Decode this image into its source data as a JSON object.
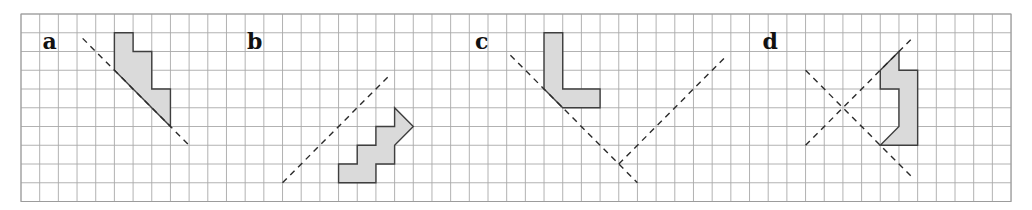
{
  "figure": {
    "grid": {
      "origin_x": 21,
      "origin_y": 14,
      "cols": 53,
      "rows": 10,
      "cell_w": 18.68,
      "cell_h": 18.75,
      "line_color": "#a9a9a9"
    },
    "colors": {
      "shape_fill": "#dadada",
      "shape_stroke": "#3e3e3e",
      "mirror_line": "#2a2a2a"
    },
    "panels": [
      {
        "label": "a",
        "label_pos": [
          1.15,
          1.85
        ],
        "shape": [
          [
            5,
            1
          ],
          [
            6,
            1
          ],
          [
            6,
            2
          ],
          [
            7,
            2
          ],
          [
            7,
            4
          ],
          [
            8,
            4
          ],
          [
            8,
            6
          ],
          [
            5,
            3
          ]
        ],
        "mirror_lines": [
          [
            [
              3.3,
              1.3
            ],
            [
              9,
              7
            ]
          ]
        ]
      },
      {
        "label": "b",
        "label_pos": [
          12.1,
          1.85
        ],
        "shape": [
          [
            17,
            9
          ],
          [
            19,
            9
          ],
          [
            19,
            8
          ],
          [
            20,
            8
          ],
          [
            20,
            7
          ],
          [
            21,
            6
          ],
          [
            20,
            5
          ],
          [
            20,
            6
          ],
          [
            19,
            6
          ],
          [
            19,
            7
          ],
          [
            18,
            7
          ],
          [
            18,
            8
          ],
          [
            17,
            8
          ]
        ],
        "mirror_lines": [
          [
            [
              14,
              9
            ],
            [
              19.8,
              3.2
            ]
          ]
        ]
      },
      {
        "label": "c",
        "label_pos": [
          24.3,
          1.85
        ],
        "shape": [
          [
            28,
            1
          ],
          [
            29,
            1
          ],
          [
            29,
            4
          ],
          [
            31,
            4
          ],
          [
            31,
            5
          ],
          [
            29,
            5
          ],
          [
            28,
            4
          ]
        ],
        "mirror_lines": [
          [
            [
              26.2,
              2.2
            ],
            [
              33,
              9
            ]
          ],
          [
            [
              32,
              8
            ],
            [
              37.8,
              2.2
            ]
          ]
        ]
      },
      {
        "label": "d",
        "label_pos": [
          39.7,
          1.85
        ],
        "shape": [
          [
            46,
            3
          ],
          [
            47,
            2
          ],
          [
            47,
            3
          ],
          [
            48,
            3
          ],
          [
            48,
            7
          ],
          [
            46,
            7
          ],
          [
            47,
            6
          ],
          [
            47,
            4
          ],
          [
            46,
            4
          ]
        ],
        "mirror_lines": [
          [
            [
              42,
              7
            ],
            [
              47.8,
              1.2
            ]
          ],
          [
            [
              42,
              3
            ],
            [
              47.8,
              8.8
            ]
          ]
        ]
      }
    ]
  }
}
